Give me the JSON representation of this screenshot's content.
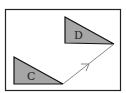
{
  "diagram": {
    "frame": {
      "x": 5,
      "y": 9,
      "width": 116,
      "height": 82,
      "stroke": "#222222"
    },
    "shapes": [
      {
        "label": "C",
        "points": "14,57 14,84 63,84",
        "fill": "#a6a6a6",
        "label_x": 27,
        "label_y": 79
      },
      {
        "label": "D",
        "points": "65,17 65,43 114,44",
        "fill": "#a6a6a6",
        "label_x": 75,
        "label_y": 39
      }
    ],
    "arrow": {
      "x1": 63,
      "y1": 84,
      "x2": 114,
      "y2": 44,
      "color": "#888888",
      "head_at": 0.5
    }
  }
}
